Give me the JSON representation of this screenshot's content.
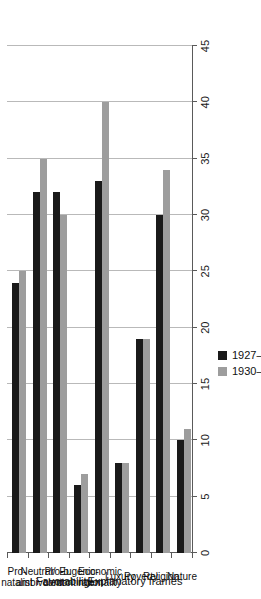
{
  "chart_data": {
    "type": "bar",
    "orientation": "horizontal",
    "title": "",
    "xlabel": "Favorability",
    "ylabel": "Explanatory frames",
    "categories": [
      "Pro-natalist",
      "Neutral/\nambivalent",
      "Pro-b.\ncontrol",
      "Eugenic-\ncontingent",
      "Economic\nrationality",
      "Luxury",
      "Poverty",
      "Religion",
      "Nature"
    ],
    "category_groups": [
      {
        "label": "Favorability",
        "members": [
          "Pro-natalist",
          "Neutral/ambivalent",
          "Pro-b. control",
          "Eugenic-contingent"
        ]
      },
      {
        "label": "Explanatory frames",
        "members": [
          "Economic rationality",
          "Luxury",
          "Poverty",
          "Religion",
          "Nature"
        ]
      }
    ],
    "series": [
      {
        "name": "1927–29 (158)",
        "color": "#1a1a1a",
        "values": [
          24,
          32,
          32,
          6,
          33,
          8,
          19,
          30,
          10
        ]
      },
      {
        "name": "1930–35 (623)",
        "color": "#9d9d9d",
        "values": [
          25,
          35,
          30,
          7,
          40,
          8,
          19,
          34,
          11
        ]
      }
    ],
    "xlim": [
      0,
      45
    ],
    "xticks": [
      0,
      5,
      10,
      15,
      20,
      25,
      30,
      35,
      40,
      45
    ],
    "xtick_labels": [
      "0",
      "5",
      "10",
      "15",
      "20",
      "25",
      "30",
      "35",
      "40",
      "45"
    ],
    "grid": true,
    "grid_axis": "x",
    "legend_position": "right"
  },
  "legend": {
    "entries": [
      {
        "label": "1927–29 (158)",
        "swatch": "black-square-swatch"
      },
      {
        "label": "1930–35 (623)",
        "swatch": "gray-square-swatch"
      }
    ]
  }
}
